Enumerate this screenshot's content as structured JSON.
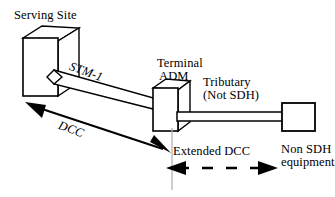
{
  "diagram": {
    "title_text": "Serving Site",
    "background_color": "#ffffff",
    "line_color": "#000000",
    "guide_line_color": "#b3b3b3",
    "nodes": {
      "serving_site": {
        "label": "Serving Site",
        "shape": "3d-cube"
      },
      "terminal_adm": {
        "label_line1": "Terminal",
        "label_line2": "ADM",
        "shape": "3d-cube"
      },
      "non_sdh_equipment": {
        "label_line1": "Non SDH",
        "label_line2": "equipment",
        "shape": "rectangle"
      }
    },
    "links": {
      "stm1": {
        "label": "STM-1",
        "style": "thick-band",
        "italic": true
      },
      "tributary": {
        "label_line1": "Tributary",
        "label_line2": "(Not SDH)",
        "style": "thick-bar"
      },
      "dcc": {
        "label": "DCC",
        "style": "solid-double-arrow",
        "italic": true
      },
      "extended_dcc": {
        "label": "Extended DCC",
        "style": "dashed-double-arrow"
      }
    }
  }
}
